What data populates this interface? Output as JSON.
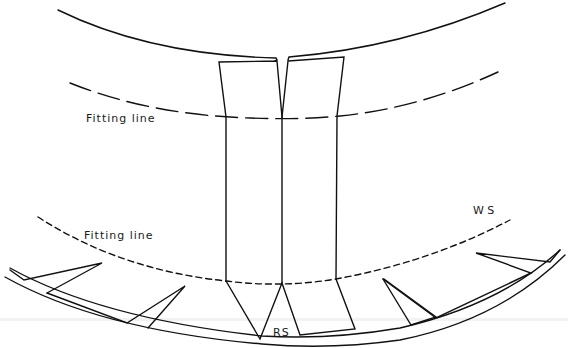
{
  "diagram": {
    "type": "technical-line-drawing",
    "stroke_color": "#111111",
    "background": "#ffffff"
  },
  "labels": {
    "fitting_line_upper": "Fitting line",
    "fitting_line_lower": "Fitting line",
    "ws": "W S",
    "rs": "RS"
  }
}
